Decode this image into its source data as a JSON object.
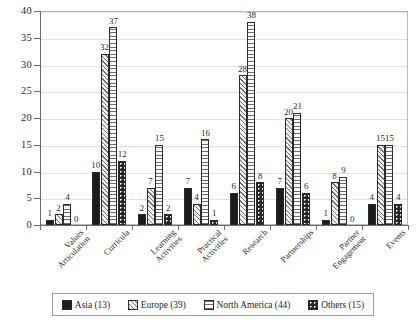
{
  "chart_data": {
    "type": "bar",
    "title": "",
    "subtitle": "",
    "xlabel": "",
    "ylabel": "",
    "ylim": [
      0,
      40
    ],
    "ytick_values": [
      0,
      5,
      10,
      15,
      20,
      25,
      30,
      35,
      40
    ],
    "ytick_labels": [
      "0",
      "5",
      "10",
      "15",
      "20",
      "25",
      "30",
      "35",
      "40"
    ],
    "grid": true,
    "grid_axis": "y",
    "legend_position": "bottom",
    "categories": [
      "Values\nArticulation",
      "Curricula",
      "Learning\nActivities",
      "Practical\nActivities",
      "Research",
      "Partnerships",
      "Partner\nEngagement",
      "Events"
    ],
    "series": [
      {
        "name": "Asia (13)",
        "pattern": "solid-black",
        "values": [
          1,
          10,
          2,
          7,
          6,
          7,
          1,
          4
        ]
      },
      {
        "name": "Europe (39)",
        "pattern": "diagonal-hatch",
        "values": [
          2,
          32,
          7,
          4,
          28,
          20,
          8,
          15
        ]
      },
      {
        "name": "North America (44)",
        "pattern": "horizontal-lines",
        "values": [
          4,
          37,
          15,
          16,
          38,
          21,
          9,
          15
        ]
      },
      {
        "name": "Others (15)",
        "pattern": "dotted-checker",
        "values": [
          0,
          12,
          2,
          1,
          8,
          6,
          0,
          4
        ]
      }
    ]
  },
  "legend": {
    "items": [
      {
        "label": "Asia (13)"
      },
      {
        "label": "Europe (39)"
      },
      {
        "label": "North America (44)"
      },
      {
        "label": "Others (15)"
      }
    ]
  },
  "colors": {
    "asia": "#1c1c1c",
    "europe": "#6e6e6e",
    "north_america": "#6b6b6b",
    "others": "#262626",
    "axis": "#6b6b6b",
    "grid": "#c9c9c9",
    "text": "#2a2a2a"
  }
}
